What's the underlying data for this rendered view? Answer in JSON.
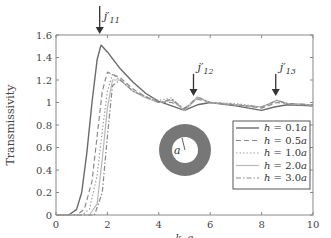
{
  "chart_data": {
    "type": "line",
    "title": "",
    "xlabel": "k0a",
    "ylabel": "Transmissivity",
    "xlim": [
      0,
      10
    ],
    "ylim": [
      0,
      1.6
    ],
    "x_ticks": [
      "0",
      "2",
      "4",
      "6",
      "8",
      "10"
    ],
    "y_ticks": [
      "0",
      "0.2",
      "0.4",
      "0.6",
      "0.8",
      "1",
      "1.2",
      "1.4",
      "1.6"
    ],
    "grid": false,
    "legend_position": "lower right (inside)",
    "series": [
      {
        "name": "h = 0.1a",
        "style": "solid",
        "x": [
          0.5,
          0.8,
          1.0,
          1.2,
          1.4,
          1.6,
          1.75,
          2.0,
          2.5,
          3.0,
          3.5,
          4.0,
          4.5,
          5.0,
          5.5,
          6.0,
          7.0,
          8.0,
          8.5,
          9.0,
          10.0
        ],
        "y": [
          0.0,
          0.05,
          0.2,
          0.55,
          1.0,
          1.38,
          1.51,
          1.45,
          1.3,
          1.18,
          1.08,
          1.01,
          0.97,
          0.93,
          0.98,
          1.0,
          0.97,
          0.93,
          0.96,
          0.98,
          0.97
        ]
      },
      {
        "name": "h = 0.5a",
        "style": "dashed",
        "x": [
          0.8,
          1.1,
          1.4,
          1.6,
          1.8,
          2.0,
          2.5,
          3.0,
          3.5,
          4.0,
          4.5,
          5.0,
          5.5,
          6.0,
          7.0,
          8.0,
          8.6,
          9.0,
          10.0
        ],
        "y": [
          0.0,
          0.05,
          0.3,
          0.7,
          1.1,
          1.27,
          1.22,
          1.12,
          1.05,
          1.0,
          1.0,
          0.95,
          1.03,
          1.0,
          0.98,
          0.95,
          1.0,
          0.99,
          0.97
        ]
      },
      {
        "name": "h = 1.0a",
        "style": "dotted",
        "x": [
          1.0,
          1.3,
          1.6,
          1.8,
          2.0,
          2.2,
          2.5,
          3.0,
          3.5,
          4.0,
          4.5,
          5.0,
          5.5,
          6.0,
          7.0,
          8.0,
          8.6,
          9.0,
          10.0
        ],
        "y": [
          0.0,
          0.05,
          0.35,
          0.75,
          1.1,
          1.25,
          1.2,
          1.1,
          1.05,
          1.02,
          1.04,
          0.92,
          1.05,
          1.0,
          0.99,
          0.96,
          1.01,
          0.99,
          0.98
        ]
      },
      {
        "name": "h = 2.0a",
        "style": "solid-light",
        "x": [
          1.3,
          1.6,
          1.8,
          2.0,
          2.2,
          2.5,
          3.0,
          3.5,
          4.0,
          4.5,
          5.0,
          5.5,
          6.0,
          7.0,
          8.0,
          8.6,
          9.0,
          10.0
        ],
        "y": [
          0.0,
          0.1,
          0.5,
          0.95,
          1.2,
          1.2,
          1.1,
          1.04,
          1.0,
          1.02,
          0.93,
          1.04,
          1.0,
          0.98,
          0.96,
          1.02,
          0.99,
          0.98
        ]
      },
      {
        "name": "h = 3.0a",
        "style": "dash-dot",
        "x": [
          1.5,
          1.8,
          2.0,
          2.2,
          2.5,
          3.0,
          3.5,
          4.0,
          4.5,
          5.0,
          5.5,
          6.0,
          7.0,
          8.0,
          8.6,
          9.0,
          10.0
        ],
        "y": [
          0.0,
          0.2,
          0.7,
          1.15,
          1.2,
          1.1,
          1.05,
          1.0,
          1.03,
          0.94,
          1.05,
          1.0,
          0.98,
          0.96,
          1.02,
          0.99,
          0.98
        ]
      }
    ],
    "annotations": [
      {
        "text": "j'11",
        "x": 1.7,
        "arrow_to_y": 1.6
      },
      {
        "text": "j'12",
        "x": 5.35,
        "arrow_to_y": 1.05
      },
      {
        "text": "j'13",
        "x": 8.55,
        "arrow_to_y": 1.05
      },
      {
        "text": "a",
        "type": "inset-annulus-radius-label"
      }
    ],
    "inset": {
      "shape": "annulus",
      "fill": "#777777",
      "label": "a"
    }
  }
}
